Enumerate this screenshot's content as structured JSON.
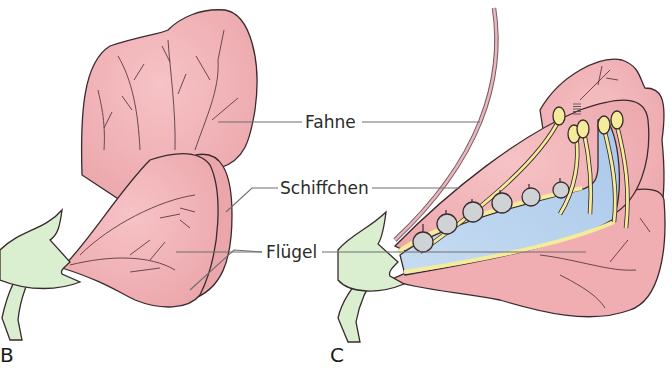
{
  "figure": {
    "panels": [
      {
        "id": "B",
        "label": "B",
        "description": "Schmetterlingsblüte, Außenansicht"
      },
      {
        "id": "C",
        "label": "C",
        "description": "Schmetterlingsblüte, Längsschnitt"
      }
    ],
    "labels": {
      "fahne": "Fahne",
      "schiffchen": "Schiffchen",
      "fluegel": "Flügel"
    },
    "colors": {
      "petal": "#f2b3b7",
      "petal_dark": "#eaa3a8",
      "sepal": "#d9efcf",
      "keel_inner": "#bcd6f0",
      "stamen": "#f4ec9a",
      "ovule": "#cfd3d6",
      "style": "#d9a9b0"
    }
  }
}
